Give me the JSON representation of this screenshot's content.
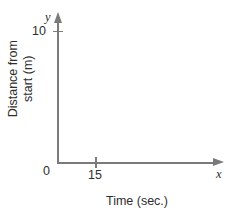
{
  "chart_data": {
    "type": "line",
    "title": "",
    "xlabel": "Time (sec.)",
    "ylabel_lines": [
      "Distance from",
      "start (m)"
    ],
    "ylabel": "Distance from start (m)",
    "x_variable": "x",
    "y_variable": "y",
    "x_ticks": [
      "0",
      "15"
    ],
    "y_ticks": [
      "10"
    ],
    "x_tick_values": [
      0,
      15
    ],
    "y_tick_values": [
      10
    ],
    "origin_label": "0",
    "xlim": [
      0,
      27
    ],
    "ylim": [
      0,
      13
    ],
    "grid": false,
    "legend": false,
    "series": [],
    "annotations": []
  },
  "axis_color": "#7a7a7a",
  "text_color": "#2e2e2e",
  "background": "#ffffff"
}
